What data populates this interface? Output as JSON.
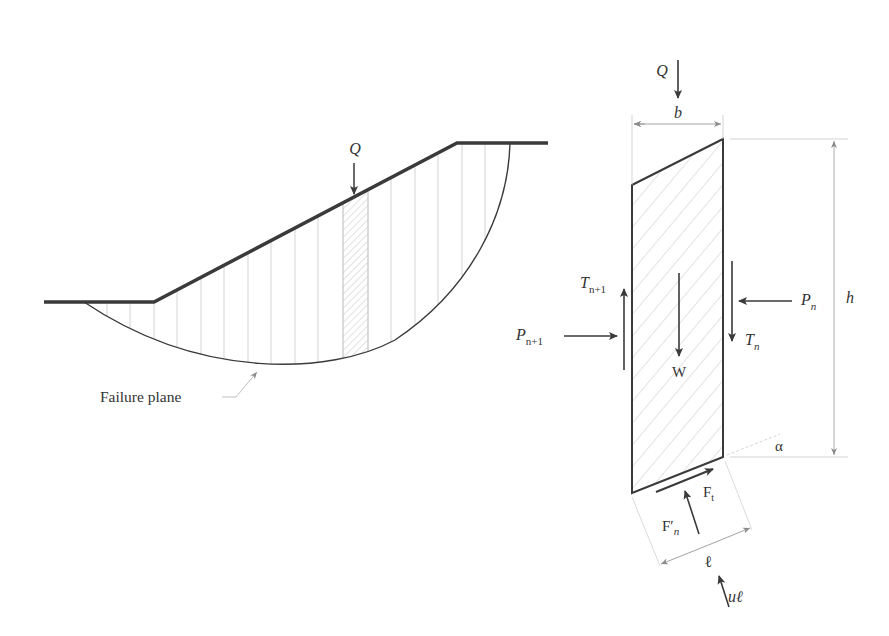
{
  "figure": {
    "colors": {
      "stroke_main": "#3a3a3a",
      "stroke_light": "#bdbdbd",
      "hatch": "#b8b8b8",
      "dimension": "#9a9a9a",
      "text": "#333333"
    }
  },
  "slope": {
    "load_label": "Q",
    "failure_label": "Failure plane",
    "slice_count": 18,
    "highlighted_slice_index": 11
  },
  "slice_fbd": {
    "load": {
      "symbol": "Q"
    },
    "width": {
      "symbol": "b"
    },
    "height": {
      "symbol": "h"
    },
    "weight": {
      "symbol": "W"
    },
    "base_angle": {
      "symbol": "α"
    },
    "base_length": {
      "symbol": "ℓ"
    },
    "left_normal": {
      "symbol": "P",
      "subscript": "n+1"
    },
    "left_shear": {
      "symbol": "T",
      "subscript": "n+1"
    },
    "right_normal": {
      "symbol": "P",
      "subscript": "n"
    },
    "right_shear": {
      "symbol": "T",
      "subscript": "n"
    },
    "base_shear": {
      "symbol": "F",
      "subscript": "t"
    },
    "base_normal": {
      "symbol": "F′",
      "subscript": "n"
    },
    "pore_pressure": {
      "symbol": "uℓ"
    }
  }
}
